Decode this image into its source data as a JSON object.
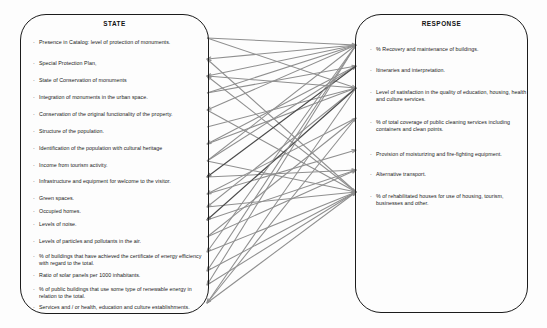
{
  "diagram": {
    "type": "bipartite-link-diagram",
    "background_color": "#ffffff",
    "panel_border_color": "#1c1c1c",
    "link_color": "#8f8f8f",
    "link_color_dark": "#4a4a4a"
  },
  "state_panel": {
    "title": "STATE",
    "bullet": "·",
    "items": [
      {
        "id": "s1",
        "label": "Presence in Catalog: level of protection of monuments."
      },
      {
        "id": "s2",
        "label": "Special Protection Plan,"
      },
      {
        "id": "s3",
        "label": "State of Conservation of monuments"
      },
      {
        "id": "s4",
        "label": "Integration of monuments in the urban space."
      },
      {
        "id": "s5",
        "label": "Conservation of the original functionality of the property."
      },
      {
        "id": "s6",
        "label": "Structure of the population."
      },
      {
        "id": "s7",
        "label": "Identification of the population with cultural heritage"
      },
      {
        "id": "s8",
        "label": "Income from tourism activity."
      },
      {
        "id": "s9",
        "label": "Infrastructure and equipment for welcome to the visitor."
      },
      {
        "id": "s10",
        "label": "Green spaces."
      },
      {
        "id": "s11",
        "label": "Occupied homes."
      },
      {
        "id": "s12",
        "label": "Levels of noise."
      },
      {
        "id": "s13",
        "label": "Levels of particles and pollutants in the air."
      },
      {
        "id": "s14",
        "label": "% of buildings that have achieved the certificate of energy efficiency with regard to the total."
      },
      {
        "id": "s15",
        "label": "Ratio of solar panels per 1000 inhabitants."
      },
      {
        "id": "s16",
        "label": "% of public buildings that use some type of renewable energy in relation to the total."
      },
      {
        "id": "s17",
        "label": "Services and / or health, education and culture establishments."
      }
    ]
  },
  "response_panel": {
    "title": "RESPONSE",
    "bullet": "·",
    "items": [
      {
        "id": "r1",
        "label": "% Recovery and maintenance of buildings."
      },
      {
        "id": "r2",
        "label": "Itineraries and interpretation."
      },
      {
        "id": "r3",
        "label": "Level of satisfaction in the quality of education, housing, health and culture services."
      },
      {
        "id": "r4",
        "label": "% of total coverage of public cleaning services including containers and clean points."
      },
      {
        "id": "r5",
        "label": "Provision of moisturizing and fire-fighting equipment."
      },
      {
        "id": "r6",
        "label": "Alternative transport."
      },
      {
        "id": "r7",
        "label": "% of rehabilitated houses for use of housing, tourism, businesses and other."
      }
    ]
  },
  "layout": {
    "state_item_y": [
      38,
      59,
      76,
      93,
      110,
      127,
      144,
      161,
      177,
      194,
      207,
      220,
      237,
      252,
      271,
      285,
      303
    ],
    "response_item_y": [
      45,
      66,
      88,
      118,
      150,
      170,
      192
    ],
    "state_edge_x": 207,
    "response_edge_x": 356
  },
  "links": [
    {
      "from": "s1",
      "to": "r1",
      "dir": "to-right",
      "dark": false
    },
    {
      "from": "s1",
      "to": "r3",
      "dir": "to-right",
      "dark": false
    },
    {
      "from": "s2",
      "to": "r1",
      "dir": "to-left",
      "dark": false
    },
    {
      "from": "s2",
      "to": "r7",
      "dir": "to-left",
      "dark": false
    },
    {
      "from": "s3",
      "to": "r1",
      "dir": "to-left",
      "dark": false
    },
    {
      "from": "s3",
      "to": "r3",
      "dir": "to-left",
      "dark": false
    },
    {
      "from": "s3",
      "to": "r7",
      "dir": "to-left",
      "dark": false
    },
    {
      "from": "s4",
      "to": "r1",
      "dir": "to-right",
      "dark": false
    },
    {
      "from": "s4",
      "to": "r2",
      "dir": "to-right",
      "dark": false
    },
    {
      "from": "s5",
      "to": "r1",
      "dir": "to-left",
      "dark": false
    },
    {
      "from": "s5",
      "to": "r7",
      "dir": "to-right",
      "dark": false
    },
    {
      "from": "s6",
      "to": "r3",
      "dir": "to-right",
      "dark": false
    },
    {
      "from": "s7",
      "to": "r2",
      "dir": "to-left",
      "dark": false
    },
    {
      "from": "s7",
      "to": "r3",
      "dir": "to-right",
      "dark": false
    },
    {
      "from": "s8",
      "to": "r1",
      "dir": "to-right",
      "dark": false
    },
    {
      "from": "s8",
      "to": "r2",
      "dir": "to-right",
      "dark": false
    },
    {
      "from": "s8",
      "to": "r7",
      "dir": "to-right",
      "dark": false
    },
    {
      "from": "s9",
      "to": "r2",
      "dir": "to-left",
      "dark": true
    },
    {
      "from": "s9",
      "to": "r6",
      "dir": "to-right",
      "dark": false
    },
    {
      "from": "s10",
      "to": "r4",
      "dir": "to-left",
      "dark": false
    },
    {
      "from": "s10",
      "to": "r5",
      "dir": "to-right",
      "dark": false
    },
    {
      "from": "s11",
      "to": "r3",
      "dir": "to-left",
      "dark": false
    },
    {
      "from": "s11",
      "to": "r7",
      "dir": "to-right",
      "dark": false
    },
    {
      "from": "s12",
      "to": "r3",
      "dir": "to-left",
      "dark": true
    },
    {
      "from": "s12",
      "to": "r6",
      "dir": "to-right",
      "dark": false
    },
    {
      "from": "s13",
      "to": "r4",
      "dir": "to-right",
      "dark": false
    },
    {
      "from": "s13",
      "to": "r6",
      "dir": "to-right",
      "dark": false
    },
    {
      "from": "s14",
      "to": "r1",
      "dir": "to-left",
      "dark": false
    },
    {
      "from": "s14",
      "to": "r7",
      "dir": "to-right",
      "dark": false
    },
    {
      "from": "s15",
      "to": "r1",
      "dir": "to-left",
      "dark": false
    },
    {
      "from": "s15",
      "to": "r7",
      "dir": "to-right",
      "dark": false
    },
    {
      "from": "s16",
      "to": "r1",
      "dir": "to-left",
      "dark": false
    },
    {
      "from": "s16",
      "to": "r7",
      "dir": "to-right",
      "dark": false
    },
    {
      "from": "s17",
      "to": "r3",
      "dir": "to-left",
      "dark": false
    },
    {
      "from": "s17",
      "to": "r4",
      "dir": "to-left",
      "dark": false
    },
    {
      "from": "s17",
      "to": "r7",
      "dir": "to-right",
      "dark": false
    }
  ]
}
